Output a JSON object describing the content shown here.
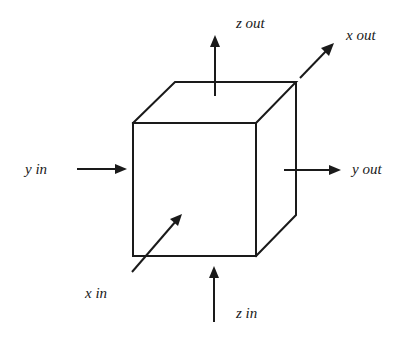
{
  "diagram": {
    "type": "control-volume-cube",
    "line_color": "#1a1a1a",
    "background": "#ffffff",
    "cube": {
      "front_face": {
        "x1": 133,
        "y1": 123,
        "x2": 256,
        "y2": 256
      },
      "back_offset": {
        "dx": 40,
        "dy": -41
      }
    },
    "labels": {
      "z_out": "z out",
      "x_out": "x out",
      "y_in": "y in",
      "y_out": "y out",
      "x_in": "x in",
      "z_in": "z in"
    },
    "arrows": [
      {
        "name": "z-out",
        "from": [
          215,
          96
        ],
        "to": [
          215,
          35
        ]
      },
      {
        "name": "x-out",
        "from": [
          300,
          78
        ],
        "to": [
          334,
          43
        ]
      },
      {
        "name": "y-in",
        "from": [
          77,
          169
        ],
        "to": [
          127,
          169
        ]
      },
      {
        "name": "y-out",
        "from": [
          284,
          170
        ],
        "to": [
          341,
          170
        ]
      },
      {
        "name": "x-in",
        "from": [
          132,
          272
        ],
        "to": [
          182,
          214
        ]
      },
      {
        "name": "z-in",
        "from": [
          214,
          322
        ],
        "to": [
          214,
          266
        ]
      }
    ]
  }
}
